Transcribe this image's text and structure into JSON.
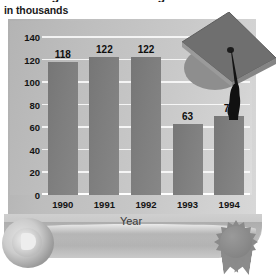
{
  "chart_data": {
    "type": "bar",
    "title": "...Earning a B.A. or B.S. Degree",
    "subtitle": "in thousands",
    "xlabel": "Year",
    "ylabel": "",
    "categories": [
      "1990",
      "1991",
      "1992",
      "1993",
      "1994"
    ],
    "values": [
      118,
      122,
      122,
      63,
      70
    ],
    "value_labels": [
      "118",
      "122",
      "122",
      "63",
      "70"
    ],
    "ylim": [
      0,
      140
    ],
    "ytick_labels": [
      "0",
      "20",
      "40",
      "60",
      "80",
      "100",
      "120",
      "140"
    ],
    "ytick_values": [
      0,
      20,
      40,
      60,
      80,
      100,
      120,
      140
    ],
    "grid": true,
    "legend": "none",
    "series": [
      {
        "name": "Degrees awarded",
        "values": [
          118,
          122,
          122,
          63,
          70
        ]
      }
    ],
    "colors": {
      "bar": "#7e7e7e",
      "plot_background": "#c6c6c6",
      "gridline": "#ffffff",
      "text": "#141414",
      "page_background": "#ffffff"
    }
  },
  "decorations": {
    "graduation_cap": "graduation-cap-icon",
    "diploma_scroll": "diploma-scroll-icon",
    "award_seal": "award-seal-icon"
  }
}
